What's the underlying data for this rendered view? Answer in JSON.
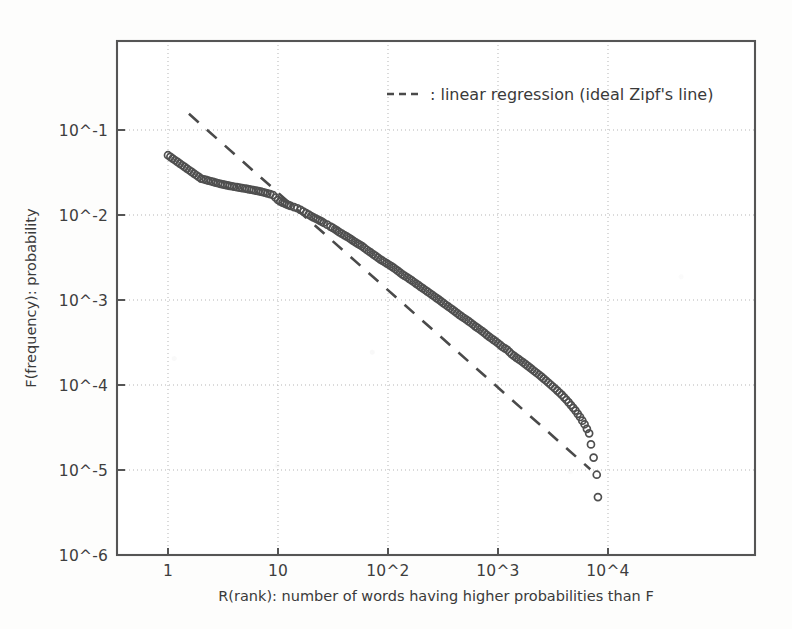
{
  "chart_data": {
    "type": "scatter",
    "title": "",
    "subtitle": "",
    "xlabel": "R(rank): number of words having higher probabilities than F",
    "ylabel": "F(frequency): probability",
    "xscale": "log",
    "yscale": "log",
    "xlim": [
      0.3,
      31623
    ],
    "ylim": [
      1e-06,
      0.3
    ],
    "grid": true,
    "xtick_labels": [
      "1",
      "10",
      "10^2",
      "10^3",
      "10^4"
    ],
    "xtick_values": [
      1,
      10,
      100,
      1000,
      10000
    ],
    "ytick_labels": [
      "10^-1",
      "10^-2",
      "10^-3",
      "10^-4",
      "10^-5",
      "10^-6"
    ],
    "ytick_values": [
      0.1,
      0.01,
      0.001,
      0.0001,
      1e-05,
      1e-06
    ],
    "legend_position": "upper-right-inside",
    "legend": [
      {
        "label": ": linear regression (ideal Zipf's line)",
        "style": "dashed",
        "color": "#4a4a4a"
      }
    ],
    "series": [
      {
        "name": "word frequency vs rank",
        "marker": "open-circle",
        "color": "#4f4f4f",
        "points": [
          [
            1,
            0.0505
          ],
          [
            2,
            0.0268
          ],
          [
            3,
            0.0232
          ],
          [
            4,
            0.0215
          ],
          [
            5,
            0.0205
          ],
          [
            6,
            0.0196
          ],
          [
            7,
            0.0188
          ],
          [
            8,
            0.018
          ],
          [
            9,
            0.0172
          ],
          [
            10,
            0.015
          ],
          [
            11,
            0.014
          ],
          [
            12,
            0.0133
          ],
          [
            13,
            0.0128
          ],
          [
            14,
            0.0124
          ],
          [
            15,
            0.012
          ],
          [
            16,
            0.0115
          ],
          [
            17,
            0.011
          ],
          [
            18,
            0.0105
          ],
          [
            19,
            0.0101
          ],
          [
            20,
            0.0097
          ],
          [
            22,
            0.0091
          ],
          [
            24,
            0.0086
          ],
          [
            26,
            0.0081
          ],
          [
            28,
            0.0077
          ],
          [
            30,
            0.0073
          ],
          [
            33,
            0.0068
          ],
          [
            36,
            0.0063
          ],
          [
            40,
            0.0058
          ],
          [
            44,
            0.0054
          ],
          [
            48,
            0.005
          ],
          [
            53,
            0.0046
          ],
          [
            58,
            0.0043
          ],
          [
            64,
            0.0039
          ],
          [
            70,
            0.0036
          ],
          [
            77,
            0.0033
          ],
          [
            85,
            0.003
          ],
          [
            93,
            0.0028
          ],
          [
            102,
            0.0026
          ],
          [
            112,
            0.0024
          ],
          [
            123,
            0.0022
          ],
          [
            135,
            0.002
          ],
          [
            149,
            0.00185
          ],
          [
            164,
            0.0017
          ],
          [
            180,
            0.00156
          ],
          [
            198,
            0.00143
          ],
          [
            218,
            0.00131
          ],
          [
            240,
            0.0012
          ],
          [
            264,
            0.0011
          ],
          [
            290,
            0.00101
          ],
          [
            319,
            0.00092
          ],
          [
            351,
            0.00084
          ],
          [
            386,
            0.00077
          ],
          [
            425,
            0.0007
          ],
          [
            467,
            0.00064
          ],
          [
            514,
            0.00059
          ],
          [
            565,
            0.00054
          ],
          [
            622,
            0.00049
          ],
          [
            684,
            0.00045
          ],
          [
            752,
            0.00041
          ],
          [
            828,
            0.00037
          ],
          [
            910,
            0.00034
          ],
          [
            1001,
            0.00031
          ],
          [
            1101,
            0.00028
          ],
          [
            1212,
            0.00026
          ],
          [
            1333,
            0.00023
          ],
          [
            1466,
            0.00021
          ],
          [
            1613,
            0.000193
          ],
          [
            1774,
            0.000176
          ],
          [
            1952,
            0.00016
          ],
          [
            2147,
            0.000145
          ],
          [
            2362,
            0.000132
          ],
          [
            2598,
            0.000119
          ],
          [
            2858,
            0.000107
          ],
          [
            3144,
            9.6e-05
          ],
          [
            3458,
            8.6e-05
          ],
          [
            3804,
            7.65e-05
          ],
          [
            4184,
            6.7e-05
          ],
          [
            4603,
            5.8e-05
          ],
          [
            5063,
            5e-05
          ],
          [
            5569,
            4.2e-05
          ],
          [
            6126,
            3.45e-05
          ],
          [
            6739,
            2.7e-05
          ],
          [
            7000,
            2e-05
          ],
          [
            7400,
            1.4e-05
          ],
          [
            7900,
            8.8e-06
          ],
          [
            8100,
            4.8e-06
          ]
        ]
      }
    ],
    "regression_line": {
      "name": "linear regression (ideal Zipf's line)",
      "style": "dashed",
      "color": "#4a4a4a",
      "endpoints": [
        [
          1.55,
          0.155
        ],
        [
          6900,
          1.02e-05
        ]
      ],
      "slope_loglog": -0.89
    }
  },
  "axis_labels": {
    "x_title": "R(rank): number of words having higher probabilities than F",
    "y_title": "F(frequency): probability"
  },
  "legend": {
    "entry_label": ": linear regression (ideal Zipf's line)"
  },
  "colors": {
    "ink": "#3a3a3a",
    "marker": "#4f4f4f",
    "grid": "#b9b9b9",
    "frame": "#555555",
    "background": "#fdfdfc"
  }
}
